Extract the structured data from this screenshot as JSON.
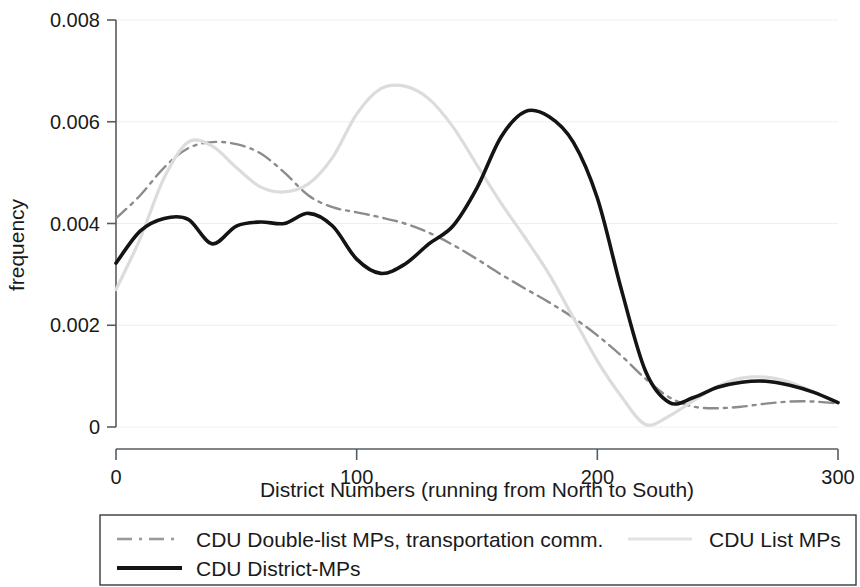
{
  "chart_data": {
    "type": "line",
    "title": "",
    "xlabel": "District Numbers (running from North to South)",
    "ylabel": "frequency",
    "xlim": [
      0,
      300
    ],
    "ylim": [
      0,
      0.008
    ],
    "xticks": [
      "0",
      "100",
      "200",
      "300"
    ],
    "xtick_values": [
      0,
      100,
      200,
      300
    ],
    "yticks": [
      "0",
      "0.002",
      "0.004",
      "0.006",
      "0.008"
    ],
    "ytick_values": [
      0,
      0.002,
      0.004,
      0.006,
      0.008
    ],
    "grid": true,
    "legend_position": "below-plot",
    "series": [
      {
        "name": "CDU Double-list MPs, transportation comm.",
        "style": "dash-dot",
        "color": "#8c8c8c",
        "width": 2.4,
        "x": [
          0,
          10,
          20,
          30,
          40,
          50,
          60,
          70,
          80,
          90,
          100,
          110,
          120,
          130,
          140,
          150,
          160,
          170,
          180,
          190,
          200,
          210,
          220,
          230,
          240,
          250,
          260,
          270,
          280,
          290,
          300
        ],
        "y": [
          0.0041,
          0.00455,
          0.0051,
          0.00548,
          0.0056,
          0.00556,
          0.00538,
          0.005,
          0.00455,
          0.00432,
          0.00422,
          0.00412,
          0.004,
          0.00382,
          0.00358,
          0.0033,
          0.003,
          0.00272,
          0.00245,
          0.00215,
          0.0018,
          0.0014,
          0.00095,
          0.00058,
          0.0004,
          0.00037,
          0.0004,
          0.00046,
          0.0005,
          0.0005,
          0.00046
        ]
      },
      {
        "name": "CDU List MPs",
        "style": "solid",
        "color": "#dcdcdc",
        "width": 3.2,
        "x": [
          0,
          10,
          20,
          30,
          40,
          50,
          60,
          70,
          80,
          90,
          100,
          110,
          120,
          130,
          140,
          150,
          160,
          170,
          180,
          190,
          200,
          210,
          220,
          230,
          240,
          250,
          260,
          270,
          280,
          290,
          300
        ],
        "y": [
          0.0027,
          0.0037,
          0.0049,
          0.0056,
          0.00552,
          0.0051,
          0.00472,
          0.00462,
          0.00478,
          0.0053,
          0.00615,
          0.00665,
          0.0067,
          0.00645,
          0.0059,
          0.00515,
          0.0044,
          0.00372,
          0.003,
          0.00215,
          0.0013,
          0.0006,
          5e-05,
          0.00022,
          0.00052,
          0.0008,
          0.00096,
          0.00098,
          0.00088,
          0.00068,
          0.00048
        ]
      },
      {
        "name": "CDU District-MPs",
        "style": "solid",
        "color": "#141414",
        "width": 3.6,
        "x": [
          0,
          10,
          20,
          30,
          40,
          50,
          60,
          70,
          80,
          90,
          100,
          110,
          120,
          130,
          140,
          150,
          160,
          170,
          180,
          190,
          200,
          210,
          220,
          230,
          240,
          250,
          260,
          270,
          280,
          290,
          300
        ],
        "y": [
          0.00322,
          0.00385,
          0.0041,
          0.00408,
          0.0036,
          0.00395,
          0.00403,
          0.004,
          0.0042,
          0.00395,
          0.0033,
          0.00302,
          0.0032,
          0.0036,
          0.00395,
          0.0047,
          0.0057,
          0.0062,
          0.0061,
          0.0056,
          0.0045,
          0.0027,
          0.0011,
          0.00048,
          0.00058,
          0.00078,
          0.00088,
          0.0009,
          0.00082,
          0.00068,
          0.00048
        ]
      }
    ]
  },
  "legend": {
    "entries": [
      {
        "label": "CDU Double-list MPs, transportation comm.",
        "swatch": "dash-dot-gray-line"
      },
      {
        "label": "CDU List MPs",
        "swatch": "solid-lightgray-line"
      },
      {
        "label": "CDU District-MPs",
        "swatch": "solid-black-line"
      }
    ]
  }
}
